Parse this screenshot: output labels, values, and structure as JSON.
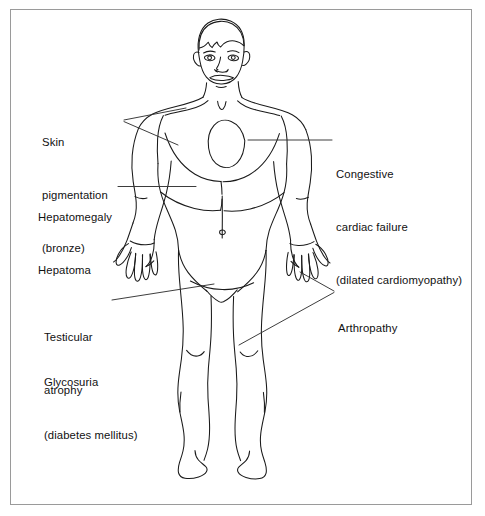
{
  "diagram": {
    "figure_name": "male-body-front-view-line-drawing",
    "frame_color": "#9a9a9a",
    "ink_color": "#1a1a1a",
    "background_color": "#ffffff",
    "labels": [
      {
        "id": "skin-pigmentation",
        "side": "left",
        "lines": [
          "Skin",
          "pigmentation",
          "(bronze)"
        ],
        "leader_targets": [
          "shoulder",
          "upper-torso"
        ]
      },
      {
        "id": "hepatomegaly-hepatoma",
        "side": "left",
        "lines": [
          "Hepatomegaly",
          "Hepatoma"
        ],
        "leader_targets": [
          "liver"
        ]
      },
      {
        "id": "testicular-atrophy",
        "side": "left",
        "lines": [
          "Testicular",
          "atrophy"
        ],
        "leader_targets": [
          "groin"
        ]
      },
      {
        "id": "glycosuria",
        "side": "left",
        "lines": [
          "Glycosuria",
          "(diabetes mellitus)"
        ],
        "leader_targets": []
      },
      {
        "id": "congestive-cardiac-failure",
        "side": "right",
        "lines": [
          "Congestive",
          "cardiac failure",
          "(dilated cardiomyopathy)"
        ],
        "leader_targets": [
          "heart"
        ]
      },
      {
        "id": "arthropathy",
        "side": "right",
        "lines": [
          "Arthropathy"
        ],
        "leader_targets": [
          "right-hand",
          "left-knee"
        ]
      }
    ]
  }
}
